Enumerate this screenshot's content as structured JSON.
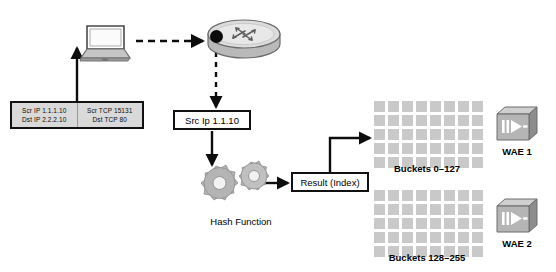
{
  "diagram": {
    "packet_header": {
      "name": "packet-header-box",
      "rows": [
        {
          "left": "Scr IP 1.1.1.10",
          "right": "Scr TCP 15131"
        },
        {
          "left": "Dst IP 2.2.2.10",
          "right": "Dst TCP 80"
        }
      ]
    },
    "src_ip_box": {
      "label": "Src Ip 1.1.10"
    },
    "result_box": {
      "label": "Result (Index)"
    },
    "hash_function": {
      "label": "Hash Function"
    },
    "buckets": [
      {
        "label": "Buckets 0–127",
        "columns": 8,
        "rows": 5,
        "count": 40
      },
      {
        "label": "Buckets 128–255",
        "columns": 8,
        "rows": 5,
        "count": 40
      }
    ],
    "appliances": [
      {
        "label": "WAE 1"
      },
      {
        "label": "WAE 2"
      }
    ],
    "devices": {
      "laptop": "laptop-icon",
      "router": "router-icon",
      "router_interface": "interface-dot-icon",
      "gears": "gears-icon"
    },
    "colors": {
      "stroke": "#111111",
      "packet_fill": "#d9d9d9",
      "bucket_fill": "#c9c9c9",
      "device_gray": "#b0b0b0",
      "background": "#ffffff"
    }
  }
}
